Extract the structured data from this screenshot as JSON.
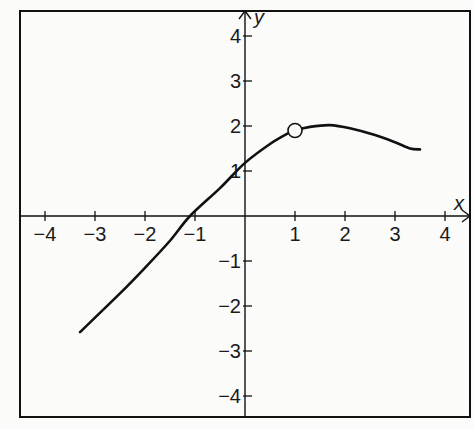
{
  "chart_data": {
    "type": "line",
    "title": "",
    "xlabel": "x",
    "ylabel": "y",
    "xlim": [
      -4.0,
      4.5
    ],
    "ylim": [
      -4.5,
      4.2
    ],
    "grid": false,
    "x_ticks": [
      -4,
      -3,
      -2,
      -1,
      1,
      2,
      3,
      4
    ],
    "x_tick_labels": [
      "−4",
      "−3",
      "−2",
      "−1",
      "1",
      "2",
      "3",
      "4"
    ],
    "y_ticks": [
      4,
      3,
      2,
      1,
      -1,
      -2,
      -3,
      -4
    ],
    "y_tick_labels": [
      "4",
      "3",
      "2",
      "1",
      "−1",
      "−2",
      "−3",
      "−4"
    ],
    "series": [
      {
        "name": "f(x)",
        "color": "#111111",
        "points": [
          [
            -3.3,
            -2.58
          ],
          [
            -2.5,
            -1.72
          ],
          [
            -2.0,
            -1.15
          ],
          [
            -1.5,
            -0.55
          ],
          [
            -1.1,
            0.0
          ],
          [
            -0.5,
            0.62
          ],
          [
            0.0,
            1.18
          ],
          [
            0.5,
            1.6
          ],
          [
            0.85,
            1.83
          ],
          [
            1.0,
            1.9
          ],
          [
            1.3,
            1.98
          ],
          [
            1.7,
            2.02
          ],
          [
            2.1,
            1.95
          ],
          [
            2.6,
            1.8
          ],
          [
            3.0,
            1.64
          ],
          [
            3.3,
            1.5
          ],
          [
            3.5,
            1.48
          ]
        ]
      }
    ],
    "annotations": [
      {
        "type": "open-circle",
        "x": 1.0,
        "y": 1.9,
        "meaning": "hole / point excluded"
      }
    ]
  }
}
